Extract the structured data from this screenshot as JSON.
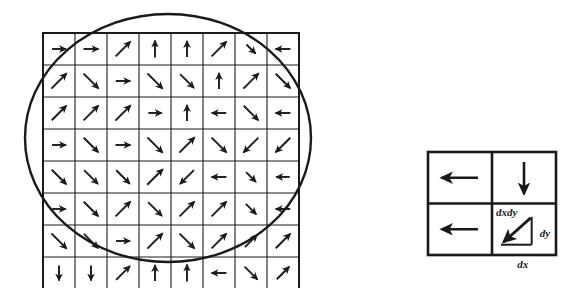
{
  "figure": {
    "stroke_color": "#1a1a1a",
    "background_color": "#ffffff"
  },
  "grid_panel": {
    "name": "vector-field-grid",
    "x": 43,
    "y": 33,
    "cell_size": 32,
    "columns": 8,
    "rows": 8,
    "circle": {
      "name": "overlay-circle",
      "cx": 168,
      "cy": 138,
      "rx": 143,
      "ry": 124,
      "stroke_width": 2.4
    },
    "arrows": [
      [
        {
          "dir": "right",
          "len": 0.58
        },
        {
          "dir": "right",
          "len": 0.62
        },
        {
          "dir": "up-right",
          "len": 0.85
        },
        {
          "dir": "up",
          "len": 0.7
        },
        {
          "dir": "up",
          "len": 0.66
        },
        {
          "dir": "up-right",
          "len": 0.86
        },
        {
          "dir": "down-right",
          "len": 0.52
        },
        {
          "dir": "left",
          "len": 0.62
        }
      ],
      [
        {
          "dir": "up-right",
          "len": 0.88
        },
        {
          "dir": "down-right",
          "len": 0.86
        },
        {
          "dir": "right",
          "len": 0.6
        },
        {
          "dir": "down-right",
          "len": 0.88
        },
        {
          "dir": "down-right",
          "len": 0.8
        },
        {
          "dir": "up",
          "len": 0.66
        },
        {
          "dir": "up-right",
          "len": 0.88
        },
        {
          "dir": "down-right",
          "len": 0.84
        }
      ],
      [
        {
          "dir": "up-right",
          "len": 0.84
        },
        {
          "dir": "up-right",
          "len": 0.86
        },
        {
          "dir": "up-right",
          "len": 0.88
        },
        {
          "dir": "right",
          "len": 0.56
        },
        {
          "dir": "up",
          "len": 0.66
        },
        {
          "dir": "left",
          "len": 0.6
        },
        {
          "dir": "down-right",
          "len": 0.84
        },
        {
          "dir": "left",
          "len": 0.62
        }
      ],
      [
        {
          "dir": "right",
          "len": 0.58
        },
        {
          "dir": "down-right",
          "len": 0.84
        },
        {
          "dir": "right",
          "len": 0.62
        },
        {
          "dir": "down-right",
          "len": 0.88
        },
        {
          "dir": "up-right",
          "len": 0.88
        },
        {
          "dir": "down-right",
          "len": 0.86
        },
        {
          "dir": "down-left",
          "len": 0.86
        },
        {
          "dir": "down-left",
          "len": 0.84
        }
      ],
      [
        {
          "dir": "down-right",
          "len": 0.84
        },
        {
          "dir": "down-right",
          "len": 0.8
        },
        {
          "dir": "down-right",
          "len": 0.78
        },
        {
          "dir": "up-right",
          "len": 0.9
        },
        {
          "dir": "down-left",
          "len": 0.8
        },
        {
          "dir": "left",
          "len": 0.62
        },
        {
          "dir": "down-right",
          "len": 0.56
        },
        {
          "dir": "left",
          "len": 0.56
        }
      ],
      [
        {
          "dir": "right",
          "len": 0.56
        },
        {
          "dir": "down-right",
          "len": 0.84
        },
        {
          "dir": "up-right",
          "len": 0.86
        },
        {
          "dir": "down-right",
          "len": 0.8
        },
        {
          "dir": "up-right",
          "len": 0.86
        },
        {
          "dir": "up-right",
          "len": 0.86
        },
        {
          "dir": "down-right",
          "len": 0.6
        },
        {
          "dir": "left",
          "len": 0.6
        }
      ],
      [
        {
          "dir": "down-right",
          "len": 0.88
        },
        {
          "dir": "down-right",
          "len": 0.82
        },
        {
          "dir": "right",
          "len": 0.58
        },
        {
          "dir": "up-right",
          "len": 0.88
        },
        {
          "dir": "down-right",
          "len": 0.86
        },
        {
          "dir": "up-right",
          "len": 0.86
        },
        {
          "dir": "up-right",
          "len": 0.7
        },
        {
          "dir": "up-right",
          "len": 0.84
        }
      ],
      [
        {
          "dir": "down",
          "len": 0.62
        },
        {
          "dir": "down",
          "len": 0.62
        },
        {
          "dir": "up-right",
          "len": 0.8
        },
        {
          "dir": "up",
          "len": 0.66
        },
        {
          "dir": "up",
          "len": 0.7
        },
        {
          "dir": "left",
          "len": 0.62
        },
        {
          "dir": "down-right",
          "len": 0.74
        },
        {
          "dir": "up-right",
          "len": 0.72
        }
      ]
    ]
  },
  "detail_panel": {
    "name": "dxdy-detail-panel",
    "x": 428,
    "y": 152,
    "width": 128,
    "height": 103,
    "cells": [
      {
        "name": "detail-cell-top-left",
        "arrow": "left"
      },
      {
        "name": "detail-cell-top-right",
        "arrow": "down"
      },
      {
        "name": "detail-cell-bottom-left",
        "arrow": "left"
      },
      {
        "name": "detail-cell-bottom-right",
        "arrow": "down-left-triangle"
      }
    ],
    "labels": {
      "dxdy": "dxdy",
      "dy": "dy",
      "dx": "dx"
    }
  }
}
